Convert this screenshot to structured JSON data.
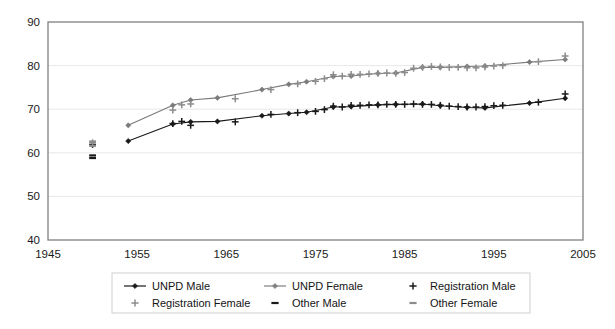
{
  "chart_data": {
    "type": "line",
    "title": "",
    "xlabel": "",
    "ylabel": "",
    "xlim": [
      1945,
      2005
    ],
    "ylim": [
      40,
      90
    ],
    "xticks": [
      "1945",
      "1955",
      "1965",
      "1975",
      "1985",
      "1995",
      "2005"
    ],
    "xtick_values": [
      1945,
      1955,
      1965,
      1975,
      1985,
      1995,
      2005
    ],
    "yticks": [
      "40",
      "50",
      "60",
      "70",
      "80",
      "90"
    ],
    "ytick_values": [
      40,
      50,
      60,
      70,
      80,
      90
    ],
    "grid": true,
    "grid_axis": "y",
    "legend_position": "bottom",
    "series": [
      {
        "name": "UNPD Male",
        "marker": "diamond",
        "color": "#1a1a1a",
        "line": true,
        "x": [
          1954,
          1959,
          1961,
          1964,
          1969,
          1972,
          1974,
          1977,
          1979,
          1982,
          1984,
          1987,
          1989,
          1992,
          1994,
          1999,
          2003
        ],
        "y": [
          62.7,
          66.6,
          67.1,
          67.2,
          68.5,
          69.0,
          69.3,
          70.5,
          70.6,
          71.0,
          71.1,
          71.2,
          70.8,
          70.4,
          70.3,
          71.4,
          72.5
        ]
      },
      {
        "name": "UNPD Female",
        "marker": "diamond",
        "color": "#7a7a7a",
        "line": true,
        "x": [
          1954,
          1959,
          1961,
          1964,
          1969,
          1972,
          1974,
          1977,
          1979,
          1982,
          1984,
          1987,
          1989,
          1992,
          1994,
          1999,
          2003
        ],
        "y": [
          66.3,
          70.9,
          72.1,
          72.6,
          74.5,
          75.7,
          76.3,
          77.5,
          77.6,
          78.2,
          78.3,
          79.6,
          79.6,
          79.8,
          79.9,
          80.8,
          81.4
        ]
      },
      {
        "name": "Registration Male",
        "marker": "plus",
        "color": "#1a1a1a",
        "line": false,
        "x": [
          1950,
          1959,
          1960,
          1961,
          1966,
          1970,
          1973,
          1975,
          1976,
          1977,
          1978,
          1979,
          1980,
          1981,
          1982,
          1983,
          1984,
          1985,
          1986,
          1987,
          1988,
          1989,
          1990,
          1991,
          1992,
          1993,
          1994,
          1995,
          1996,
          2000,
          2003
        ],
        "y": [
          61.9,
          66.7,
          67.2,
          66.3,
          67.1,
          68.8,
          69.2,
          69.5,
          69.9,
          70.7,
          70.5,
          70.9,
          70.9,
          71.0,
          71.0,
          71.1,
          71.1,
          71.1,
          71.2,
          71.1,
          71.1,
          70.9,
          70.7,
          70.6,
          70.5,
          70.5,
          70.6,
          70.8,
          70.9,
          71.6,
          73.5
        ]
      },
      {
        "name": "Registration Female",
        "marker": "plus",
        "color": "#8c8c8c",
        "line": false,
        "x": [
          1950,
          1959,
          1960,
          1961,
          1966,
          1970,
          1973,
          1975,
          1976,
          1977,
          1978,
          1979,
          1980,
          1981,
          1982,
          1983,
          1984,
          1985,
          1986,
          1987,
          1988,
          1989,
          1990,
          1991,
          1992,
          1993,
          1994,
          1995,
          1996,
          2000,
          2003
        ],
        "y": [
          62.3,
          69.8,
          71.0,
          71.2,
          72.4,
          74.5,
          75.8,
          76.4,
          77.0,
          77.9,
          77.6,
          78.0,
          78.0,
          78.1,
          78.2,
          78.3,
          78.2,
          78.4,
          79.4,
          79.6,
          79.8,
          79.7,
          79.6,
          79.6,
          79.5,
          79.5,
          79.7,
          79.9,
          80.0,
          80.9,
          82.2
        ]
      },
      {
        "name": "Other Male",
        "marker": "dash",
        "color": "#1a1a1a",
        "line": false,
        "x": [
          1950,
          1950
        ],
        "y": [
          58.8,
          59.4
        ]
      },
      {
        "name": "Other Female",
        "marker": "dash",
        "color": "#8c8c8c",
        "line": false,
        "x": [
          1950,
          1950
        ],
        "y": [
          61.6,
          62.6
        ]
      }
    ]
  },
  "legend": {
    "items": [
      {
        "label": "UNPD Male",
        "marker": "line-diamond",
        "color": "#1a1a1a"
      },
      {
        "label": "UNPD Female",
        "marker": "line-diamond",
        "color": "#7f7f7f"
      },
      {
        "label": "Registration Male",
        "marker": "plus",
        "color": "#1a1a1a"
      },
      {
        "label": "Registration Female",
        "marker": "plus",
        "color": "#8c8c8c"
      },
      {
        "label": "Other Male",
        "marker": "dash",
        "color": "#1a1a1a"
      },
      {
        "label": "Other Female",
        "marker": "dash",
        "color": "#8c8c8c"
      }
    ]
  },
  "axes": {
    "plot_border_color": "#808080",
    "gridline_color": "#e8e8e8",
    "background": "#ffffff"
  }
}
